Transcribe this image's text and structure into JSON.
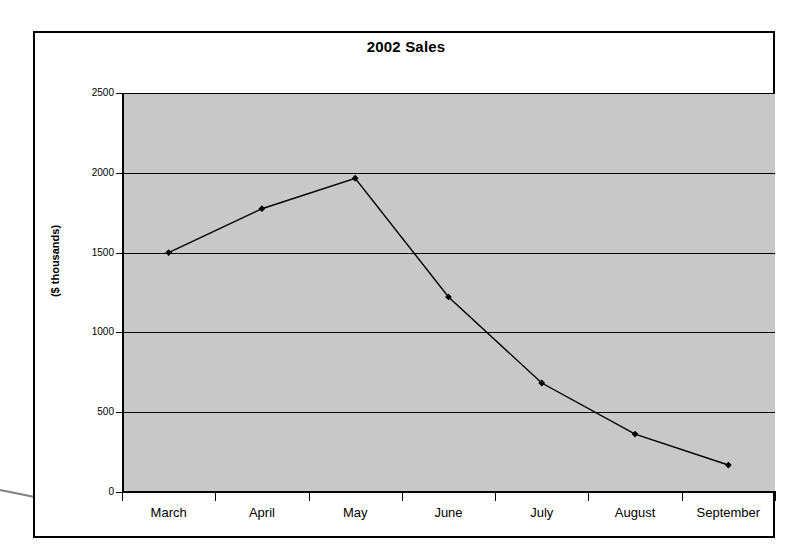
{
  "chart_data": {
    "type": "line",
    "title": "2002 Sales",
    "xlabel": "",
    "ylabel": "($ thousands)",
    "categories": [
      "March",
      "April",
      "May",
      "June",
      "July",
      "August",
      "September"
    ],
    "values": [
      1500,
      1775,
      1966,
      1222,
      683,
      363,
      169
    ],
    "series": [
      {
        "name": "2002 Sales",
        "values": [
          1500,
          1775,
          1966,
          1222,
          683,
          363,
          169
        ]
      }
    ],
    "ylim": [
      0,
      2500
    ],
    "y_ticks": [
      0,
      500,
      1000,
      1500,
      2000,
      2500
    ],
    "y_tick_labels": [
      "0",
      "500",
      "1000",
      "1500",
      "2000",
      "2500"
    ],
    "grid": "horizontal",
    "legend": "none",
    "plot_background_color": "#c8c8c8",
    "line_color": "#000000",
    "marker": "diamond"
  },
  "annotations": {
    "leader_line_color": "#808080"
  }
}
